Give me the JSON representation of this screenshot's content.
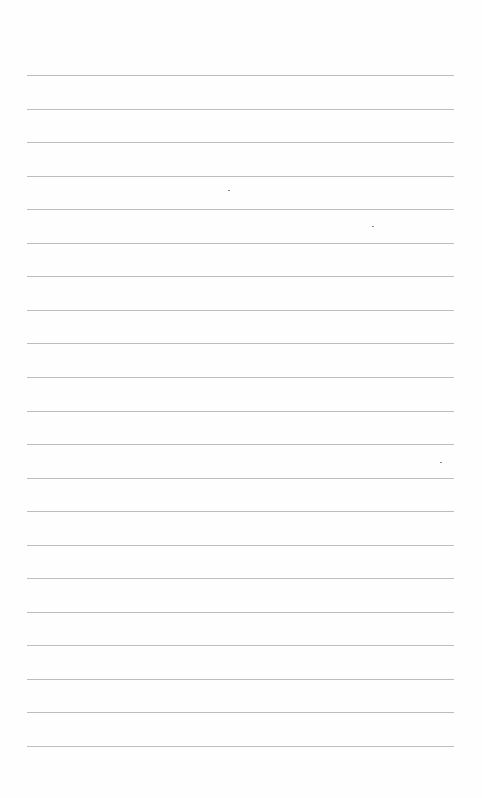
{
  "page": {
    "type": "lined-paper",
    "rule_count": 21,
    "rule_color": "#bdbdbd",
    "background_color": "#fefefe",
    "content": []
  }
}
